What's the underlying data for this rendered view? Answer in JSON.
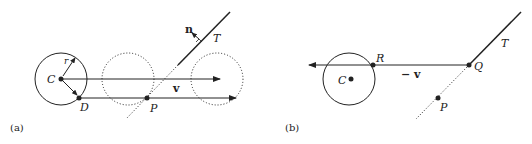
{
  "panel_a": {
    "caption": "(a)",
    "labels": {
      "center": "C",
      "radius": "r",
      "contact": "D",
      "point": "P",
      "plane": "T",
      "normal": "n",
      "velocity": "v"
    }
  },
  "panel_b": {
    "caption": "(b)",
    "labels": {
      "center": "C",
      "hit": "R",
      "plane_hit": "Q",
      "point": "P",
      "plane": "T",
      "neg_velocity": "− v"
    }
  },
  "colors": {
    "stroke": "#222222",
    "background": "#ffffff"
  }
}
